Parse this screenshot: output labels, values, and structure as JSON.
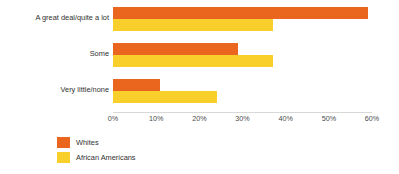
{
  "chart_data": {
    "type": "bar",
    "orientation": "horizontal",
    "title": "",
    "subtitle": "",
    "xlabel": "",
    "ylabel": "",
    "xlim": [
      0,
      60
    ],
    "grid": false,
    "legend_position": "bottom-left",
    "categories": [
      "A great deal/quite a lot",
      "Some",
      "Very little/none"
    ],
    "tick_labels": [
      "0%",
      "10%",
      "20%",
      "30%",
      "40%",
      "50%",
      "60%"
    ],
    "tick_values": [
      0,
      10,
      20,
      30,
      40,
      50,
      60
    ],
    "series": [
      {
        "name": "Whites",
        "color": "#ea661e",
        "values": [
          59,
          29,
          11
        ]
      },
      {
        "name": "African Americans",
        "color": "#f9cf2c",
        "values": [
          37,
          37,
          24
        ]
      }
    ]
  },
  "legend": {
    "items": [
      {
        "label": "Whites",
        "color": "#ea661e"
      },
      {
        "label": "African Americans",
        "color": "#f9cf2c"
      }
    ]
  }
}
